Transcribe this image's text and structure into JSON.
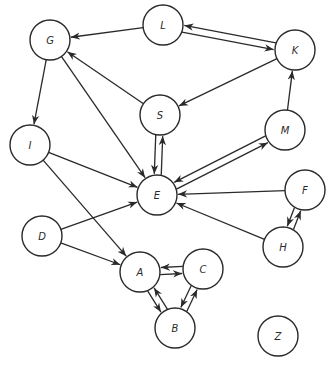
{
  "diagram": {
    "type": "directed-graph",
    "nodes": [
      {
        "id": "G",
        "label": "G"
      },
      {
        "id": "L",
        "label": "L"
      },
      {
        "id": "K",
        "label": "K"
      },
      {
        "id": "S",
        "label": "S"
      },
      {
        "id": "I",
        "label": "I"
      },
      {
        "id": "M",
        "label": "M"
      },
      {
        "id": "E",
        "label": "E"
      },
      {
        "id": "F",
        "label": "F"
      },
      {
        "id": "D",
        "label": "D"
      },
      {
        "id": "H",
        "label": "H"
      },
      {
        "id": "A",
        "label": "A"
      },
      {
        "id": "C",
        "label": "C"
      },
      {
        "id": "B",
        "label": "B"
      },
      {
        "id": "Z",
        "label": "Z"
      }
    ],
    "edges": [
      {
        "from": "L",
        "to": "G"
      },
      {
        "from": "L",
        "to": "K"
      },
      {
        "from": "K",
        "to": "L"
      },
      {
        "from": "K",
        "to": "S"
      },
      {
        "from": "S",
        "to": "G"
      },
      {
        "from": "S",
        "to": "E"
      },
      {
        "from": "E",
        "to": "S"
      },
      {
        "from": "G",
        "to": "I"
      },
      {
        "from": "G",
        "to": "E"
      },
      {
        "from": "I",
        "to": "E"
      },
      {
        "from": "I",
        "to": "A"
      },
      {
        "from": "E",
        "to": "M"
      },
      {
        "from": "M",
        "to": "E"
      },
      {
        "from": "M",
        "to": "K"
      },
      {
        "from": "F",
        "to": "E"
      },
      {
        "from": "H",
        "to": "E"
      },
      {
        "from": "F",
        "to": "H"
      },
      {
        "from": "H",
        "to": "F"
      },
      {
        "from": "D",
        "to": "E"
      },
      {
        "from": "D",
        "to": "A"
      },
      {
        "from": "A",
        "to": "C"
      },
      {
        "from": "C",
        "to": "A"
      },
      {
        "from": "A",
        "to": "B"
      },
      {
        "from": "B",
        "to": "A"
      },
      {
        "from": "B",
        "to": "C"
      },
      {
        "from": "C",
        "to": "B"
      }
    ]
  }
}
